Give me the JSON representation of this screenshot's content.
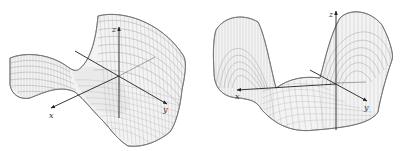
{
  "figure": {
    "colors": {
      "background": "#ffffff",
      "surface_outline": "#6e6e6e",
      "mesh": "#b5b5b5",
      "axis": "#222222"
    },
    "plots": [
      {
        "name": "saddle-surface",
        "axes": {
          "x_label": "x",
          "y_label": "y",
          "z_label": "z"
        }
      },
      {
        "name": "double-lobe-surface",
        "axes": {
          "x_label": "x",
          "y_label": "y",
          "z_label": "z"
        }
      }
    ]
  }
}
